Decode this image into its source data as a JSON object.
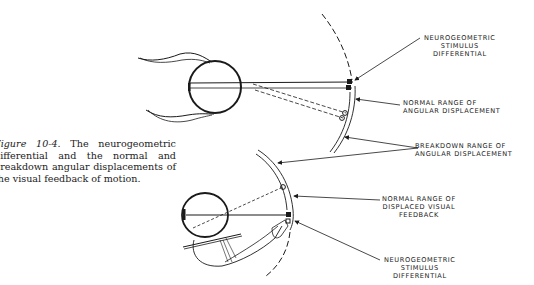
{
  "caption": {
    "figure_label": "Figure 10-4.",
    "text": "The neurogeometric differential and the normal and breakdown angular displacements of the visual feedback of motion."
  },
  "labels": {
    "top_stimulus": [
      "NEUROGEOMETRIC",
      "STIMULUS",
      "DIFFERENTIAL"
    ],
    "normal_angular": [
      "NORMAL RANGE OF",
      "ANGULAR DISPLACEMENT"
    ],
    "breakdown_angular": [
      "BREAKDOWN RANGE OF",
      "ANGULAR DISPLACEMENT"
    ],
    "normal_displaced": [
      "NORMAL RANGE OF",
      "DISPLACED VISUAL",
      "FEEDBACK"
    ],
    "bottom_stimulus": [
      "NEUROGEOMETRIC",
      "STIMULUS",
      "DIFFERENTIAL"
    ]
  },
  "colors": {
    "ink": "#1a1a1a",
    "background": "#ffffff"
  }
}
